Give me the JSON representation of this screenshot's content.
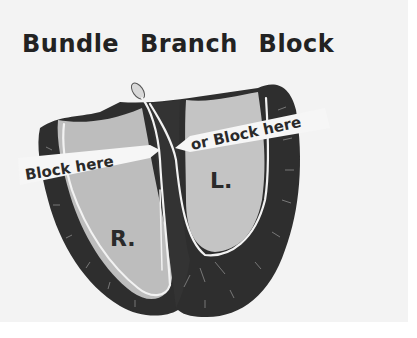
{
  "diagram": {
    "title": "Bundle Branch Block",
    "labels": {
      "right_ventricle": "R.",
      "left_ventricle": "L."
    },
    "arrows": {
      "right_block": "Block here",
      "left_block": "or Block here"
    },
    "colors": {
      "background": "#f3f3f3",
      "myocardium": "#2e2e2e",
      "chamber": "#bdbdbd",
      "conduction": "#f2f2f2",
      "text": "#222222"
    }
  }
}
